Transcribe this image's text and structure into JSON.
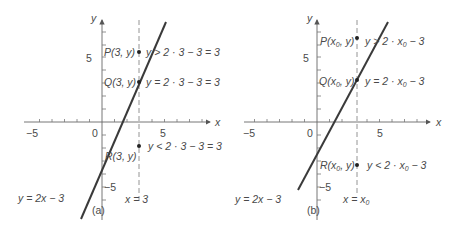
{
  "panels": [
    {
      "id": "a",
      "caption": "(a)",
      "axis_x_label": "x",
      "axis_y_label": "y",
      "tick_labels": {
        "x_neg": "−5",
        "origin": "0",
        "x_pos": "5",
        "y_pos": "5",
        "y_neg": "−5"
      },
      "line_label": "y = 2x − 3",
      "vertical_line_label": "x = 3",
      "points": [
        {
          "name": "P",
          "label": "P(3, y)",
          "relation": "y > 2 · 3 − 3 = 3"
        },
        {
          "name": "Q",
          "label": "Q(3, y)",
          "relation": "y = 2 · 3 − 3 = 3"
        },
        {
          "name": "R",
          "label": "R(3, y)",
          "relation": "y < 2 · 3 − 3 = 3"
        }
      ]
    },
    {
      "id": "b",
      "caption": "(b)",
      "axis_x_label": "x",
      "axis_y_label": "y",
      "tick_labels": {
        "x_neg": "−5",
        "origin": "0",
        "x_pos": "5",
        "y_pos": "5",
        "y_neg": "−5"
      },
      "line_label": "y = 2x − 3",
      "vertical_line_label_main": "x = x",
      "vertical_line_label_sub": "0",
      "points": [
        {
          "name": "P",
          "label_main": "P(x",
          "label_sub": "0",
          "label_end": ", y)",
          "rel_main": "y > 2 · x",
          "rel_sub": "0",
          "rel_end": " − 3"
        },
        {
          "name": "Q",
          "label_main": "Q(x",
          "label_sub": "0",
          "label_end": ", y)",
          "rel_main": "y = 2 · x",
          "rel_sub": "0",
          "rel_end": " − 3"
        },
        {
          "name": "R",
          "label_main": "R(x",
          "label_sub": "0",
          "label_end": ", y)",
          "rel_main": "y < 2 · x",
          "rel_sub": "0",
          "rel_end": " − 3"
        }
      ]
    }
  ],
  "colors": {
    "axis": "#555555",
    "line": "#3a3a3a",
    "dashed": "#888888",
    "text": "#4a4a4a",
    "point": "#222222"
  }
}
